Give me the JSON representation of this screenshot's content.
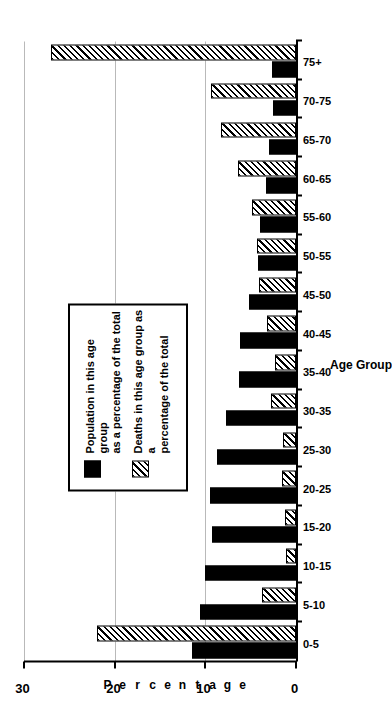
{
  "chart_data": {
    "type": "bar",
    "title": "",
    "xlabel": "Age Group",
    "ylabel": "Percentage",
    "ylim": [
      0,
      30
    ],
    "yticks": [
      0,
      10,
      20,
      30
    ],
    "grid": true,
    "orientation": "rotated-90-ccw",
    "legend_position": "inside-upper-left",
    "categories": [
      "0-5",
      "5-10",
      "10-15",
      "15-20",
      "20-25",
      "25-30",
      "30-35",
      "35-40",
      "40-45",
      "45-50",
      "50-55",
      "55-60",
      "60-65",
      "65-70",
      "70-75",
      "75+"
    ],
    "series": [
      {
        "name": "Population in this age group\nas a percentage of the total",
        "key": "population",
        "fill": "solid-black",
        "values": [
          11.5,
          10.6,
          10.0,
          9.3,
          9.5,
          8.7,
          7.7,
          6.3,
          6.2,
          5.2,
          4.2,
          4.0,
          3.3,
          3.0,
          2.5,
          2.6
        ]
      },
      {
        "name": "Deaths in this age group as a\npercentage of the total",
        "key": "deaths",
        "fill": "diagonal-hatch",
        "values": [
          22.0,
          3.7,
          1.1,
          1.2,
          1.5,
          1.4,
          2.8,
          2.3,
          3.2,
          4.1,
          4.3,
          4.8,
          6.4,
          8.3,
          9.4,
          27.0
        ]
      }
    ]
  },
  "axes": {
    "y_tick_labels": [
      "0",
      "10",
      "20",
      "30"
    ],
    "x_axis_title": "Age Group",
    "y_axis_title_letters": [
      "P",
      "e",
      "r",
      "c",
      "e",
      "n",
      "t",
      "a",
      "g",
      "e"
    ]
  },
  "legend": {
    "entries": [
      {
        "label": "Population in this age group\nas a percentage of the total",
        "swatch": "solid-black-swatch"
      },
      {
        "label": "Deaths in this age group as a\npercentage of the total",
        "swatch": "hatched-swatch"
      }
    ]
  },
  "colors": {
    "population_bar": "#000000",
    "deaths_bar_outline": "#000000",
    "deaths_bar_fill": "#ffffff",
    "gridline": "#b9b9b9",
    "axis": "#000000",
    "background": "#ffffff"
  }
}
